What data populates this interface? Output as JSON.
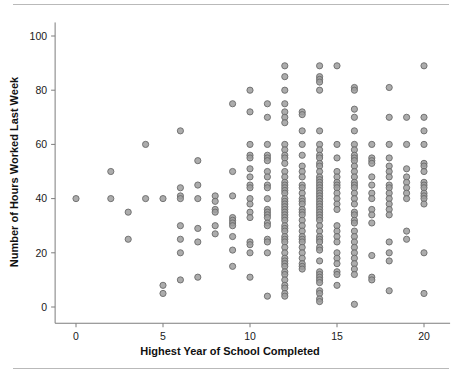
{
  "figure": {
    "background_color": "#ffffff",
    "rule_color": "#b9b9b9",
    "marker_fill": "#9d9d9d",
    "marker_stroke": "#6a6a6a"
  },
  "chart_data": {
    "type": "scatter",
    "title": "",
    "xlabel": "Highest Year of School Completed",
    "ylabel": "Number of Hours Worked Last Week",
    "xlim": [
      -1.2,
      21.5
    ],
    "ylim": [
      -6,
      105
    ],
    "xticks": [
      0,
      5,
      10,
      15,
      20
    ],
    "xtick_labels": [
      "0",
      "5",
      "10",
      "15",
      "20"
    ],
    "yticks": [
      0,
      20,
      40,
      60,
      80,
      100
    ],
    "ytick_labels": [
      "0",
      "20",
      "40",
      "60",
      "80",
      "100"
    ],
    "grid": false,
    "legend": "none",
    "marker": "circle",
    "points": [
      [
        0,
        40
      ],
      [
        2,
        50
      ],
      [
        2,
        40
      ],
      [
        3,
        35
      ],
      [
        3,
        25
      ],
      [
        4,
        60
      ],
      [
        4,
        40
      ],
      [
        5,
        40
      ],
      [
        5,
        8
      ],
      [
        5,
        5
      ],
      [
        6,
        65
      ],
      [
        6,
        44
      ],
      [
        6,
        41
      ],
      [
        6,
        40
      ],
      [
        6,
        30
      ],
      [
        6,
        25
      ],
      [
        6,
        20
      ],
      [
        6,
        10
      ],
      [
        7,
        54
      ],
      [
        7,
        45
      ],
      [
        7,
        40
      ],
      [
        7,
        29
      ],
      [
        7,
        24
      ],
      [
        7,
        11
      ],
      [
        8,
        41
      ],
      [
        8,
        39
      ],
      [
        8,
        36
      ],
      [
        8,
        35
      ],
      [
        8,
        30
      ],
      [
        8,
        27
      ],
      [
        9,
        75
      ],
      [
        9,
        50
      ],
      [
        9,
        41
      ],
      [
        9,
        33
      ],
      [
        9,
        32
      ],
      [
        9,
        31
      ],
      [
        9,
        30
      ],
      [
        9,
        26
      ],
      [
        9,
        21
      ],
      [
        9,
        15
      ],
      [
        10,
        80
      ],
      [
        10,
        72
      ],
      [
        10,
        60
      ],
      [
        10,
        56
      ],
      [
        10,
        55
      ],
      [
        10,
        51
      ],
      [
        10,
        48
      ],
      [
        10,
        45
      ],
      [
        10,
        44
      ],
      [
        10,
        40
      ],
      [
        10,
        38
      ],
      [
        10,
        35
      ],
      [
        10,
        33
      ],
      [
        10,
        24
      ],
      [
        10,
        23
      ],
      [
        10,
        20
      ],
      [
        10,
        11
      ],
      [
        11,
        75
      ],
      [
        11,
        70
      ],
      [
        11,
        60
      ],
      [
        11,
        56
      ],
      [
        11,
        55
      ],
      [
        11,
        54
      ],
      [
        11,
        50
      ],
      [
        11,
        48
      ],
      [
        11,
        45
      ],
      [
        11,
        44
      ],
      [
        11,
        40
      ],
      [
        11,
        36
      ],
      [
        11,
        35
      ],
      [
        11,
        34
      ],
      [
        11,
        33
      ],
      [
        11,
        31
      ],
      [
        11,
        30
      ],
      [
        11,
        25
      ],
      [
        11,
        24
      ],
      [
        11,
        20
      ],
      [
        11,
        4
      ],
      [
        12,
        89
      ],
      [
        12,
        85
      ],
      [
        12,
        80
      ],
      [
        12,
        75
      ],
      [
        12,
        72
      ],
      [
        12,
        70
      ],
      [
        12,
        68
      ],
      [
        12,
        60
      ],
      [
        12,
        58
      ],
      [
        12,
        56
      ],
      [
        12,
        55
      ],
      [
        12,
        53
      ],
      [
        12,
        50
      ],
      [
        12,
        48
      ],
      [
        12,
        46
      ],
      [
        12,
        45
      ],
      [
        12,
        44
      ],
      [
        12,
        43
      ],
      [
        12,
        42
      ],
      [
        12,
        40
      ],
      [
        12,
        39
      ],
      [
        12,
        38
      ],
      [
        12,
        37
      ],
      [
        12,
        36
      ],
      [
        12,
        35
      ],
      [
        12,
        34
      ],
      [
        12,
        33
      ],
      [
        12,
        32
      ],
      [
        12,
        30
      ],
      [
        12,
        29
      ],
      [
        12,
        28
      ],
      [
        12,
        26
      ],
      [
        12,
        25
      ],
      [
        12,
        24
      ],
      [
        12,
        22
      ],
      [
        12,
        20
      ],
      [
        12,
        18
      ],
      [
        12,
        17
      ],
      [
        12,
        16
      ],
      [
        12,
        15
      ],
      [
        12,
        13
      ],
      [
        12,
        12
      ],
      [
        12,
        10
      ],
      [
        12,
        8
      ],
      [
        12,
        7
      ],
      [
        12,
        5
      ],
      [
        12,
        4
      ],
      [
        13,
        72
      ],
      [
        13,
        71
      ],
      [
        13,
        65
      ],
      [
        13,
        60
      ],
      [
        13,
        56
      ],
      [
        13,
        52
      ],
      [
        13,
        50
      ],
      [
        13,
        48
      ],
      [
        13,
        45
      ],
      [
        13,
        44
      ],
      [
        13,
        42
      ],
      [
        13,
        40
      ],
      [
        13,
        39
      ],
      [
        13,
        38
      ],
      [
        13,
        36
      ],
      [
        13,
        35
      ],
      [
        13,
        34
      ],
      [
        13,
        32
      ],
      [
        13,
        30
      ],
      [
        13,
        28
      ],
      [
        13,
        26
      ],
      [
        13,
        25
      ],
      [
        13,
        24
      ],
      [
        13,
        22
      ],
      [
        13,
        20
      ],
      [
        13,
        18
      ],
      [
        13,
        16
      ],
      [
        13,
        15
      ],
      [
        13,
        14
      ],
      [
        14,
        89
      ],
      [
        14,
        85
      ],
      [
        14,
        84
      ],
      [
        14,
        83
      ],
      [
        14,
        80
      ],
      [
        14,
        65
      ],
      [
        14,
        60
      ],
      [
        14,
        58
      ],
      [
        14,
        56
      ],
      [
        14,
        55
      ],
      [
        14,
        53
      ],
      [
        14,
        52
      ],
      [
        14,
        50
      ],
      [
        14,
        48
      ],
      [
        14,
        47
      ],
      [
        14,
        46
      ],
      [
        14,
        45
      ],
      [
        14,
        44
      ],
      [
        14,
        43
      ],
      [
        14,
        42
      ],
      [
        14,
        41
      ],
      [
        14,
        40
      ],
      [
        14,
        39
      ],
      [
        14,
        38
      ],
      [
        14,
        37
      ],
      [
        14,
        36
      ],
      [
        14,
        35
      ],
      [
        14,
        34
      ],
      [
        14,
        33
      ],
      [
        14,
        32
      ],
      [
        14,
        30
      ],
      [
        14,
        28
      ],
      [
        14,
        26
      ],
      [
        14,
        25
      ],
      [
        14,
        24
      ],
      [
        14,
        22
      ],
      [
        14,
        21
      ],
      [
        14,
        17
      ],
      [
        14,
        13
      ],
      [
        14,
        12
      ],
      [
        14,
        11
      ],
      [
        14,
        10
      ],
      [
        14,
        9
      ],
      [
        14,
        6
      ],
      [
        14,
        5
      ],
      [
        14,
        3
      ],
      [
        14,
        2
      ],
      [
        15,
        89
      ],
      [
        15,
        60
      ],
      [
        15,
        55
      ],
      [
        15,
        50
      ],
      [
        15,
        48
      ],
      [
        15,
        46
      ],
      [
        15,
        45
      ],
      [
        15,
        44
      ],
      [
        15,
        42
      ],
      [
        15,
        40
      ],
      [
        15,
        38
      ],
      [
        15,
        36
      ],
      [
        15,
        30
      ],
      [
        15,
        28
      ],
      [
        15,
        26
      ],
      [
        15,
        24
      ],
      [
        15,
        20
      ],
      [
        15,
        18
      ],
      [
        15,
        16
      ],
      [
        15,
        13
      ],
      [
        15,
        12
      ],
      [
        15,
        8
      ],
      [
        16,
        81
      ],
      [
        16,
        80
      ],
      [
        16,
        73
      ],
      [
        16,
        70
      ],
      [
        16,
        65
      ],
      [
        16,
        60
      ],
      [
        16,
        58
      ],
      [
        16,
        56
      ],
      [
        16,
        55
      ],
      [
        16,
        54
      ],
      [
        16,
        52
      ],
      [
        16,
        50
      ],
      [
        16,
        48
      ],
      [
        16,
        46
      ],
      [
        16,
        45
      ],
      [
        16,
        44
      ],
      [
        16,
        42
      ],
      [
        16,
        40
      ],
      [
        16,
        38
      ],
      [
        16,
        35
      ],
      [
        16,
        34
      ],
      [
        16,
        32
      ],
      [
        16,
        31
      ],
      [
        16,
        28
      ],
      [
        16,
        26
      ],
      [
        16,
        24
      ],
      [
        16,
        22
      ],
      [
        16,
        20
      ],
      [
        16,
        18
      ],
      [
        16,
        16
      ],
      [
        16,
        14
      ],
      [
        16,
        12
      ],
      [
        16,
        1
      ],
      [
        17,
        60
      ],
      [
        17,
        55
      ],
      [
        17,
        54
      ],
      [
        17,
        53
      ],
      [
        17,
        48
      ],
      [
        17,
        45
      ],
      [
        17,
        42
      ],
      [
        17,
        40
      ],
      [
        17,
        36
      ],
      [
        17,
        34
      ],
      [
        17,
        31
      ],
      [
        17,
        19
      ],
      [
        17,
        11
      ],
      [
        17,
        10
      ],
      [
        18,
        81
      ],
      [
        18,
        70
      ],
      [
        18,
        60
      ],
      [
        18,
        55
      ],
      [
        18,
        52
      ],
      [
        18,
        50
      ],
      [
        18,
        48
      ],
      [
        18,
        45
      ],
      [
        18,
        44
      ],
      [
        18,
        42
      ],
      [
        18,
        40
      ],
      [
        18,
        38
      ],
      [
        18,
        36
      ],
      [
        18,
        34
      ],
      [
        18,
        24
      ],
      [
        18,
        20
      ],
      [
        18,
        17
      ],
      [
        18,
        6
      ],
      [
        19,
        70
      ],
      [
        19,
        60
      ],
      [
        19,
        51
      ],
      [
        19,
        48
      ],
      [
        19,
        46
      ],
      [
        19,
        44
      ],
      [
        19,
        42
      ],
      [
        19,
        40
      ],
      [
        19,
        28
      ],
      [
        19,
        25
      ],
      [
        20,
        89
      ],
      [
        20,
        70
      ],
      [
        20,
        65
      ],
      [
        20,
        60
      ],
      [
        20,
        53
      ],
      [
        20,
        52
      ],
      [
        20,
        50
      ],
      [
        20,
        46
      ],
      [
        20,
        45
      ],
      [
        20,
        44
      ],
      [
        20,
        42
      ],
      [
        20,
        41
      ],
      [
        20,
        40
      ],
      [
        20,
        38
      ],
      [
        20,
        20
      ],
      [
        20,
        5
      ]
    ]
  }
}
